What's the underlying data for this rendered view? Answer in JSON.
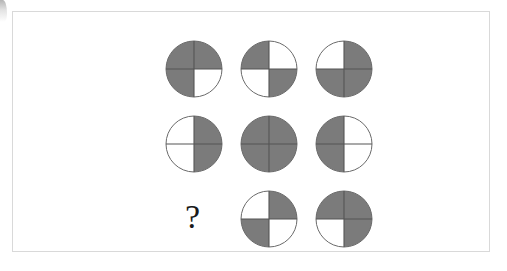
{
  "puzzle": {
    "type": "matrix-reasoning",
    "rows": 3,
    "columns": 3,
    "missing_cell": {
      "row": 3,
      "column": 1
    },
    "missing_cell_symbol": "?",
    "colors": {
      "shaded": "#7b7b7b",
      "unshaded": "#ffffff",
      "outline": "#6a6a6a",
      "divider": "#555555",
      "frame_border": "#d9d9d9",
      "background": "#ffffff",
      "question_mark": "#1a1a1a"
    },
    "circle": {
      "diameter_px": 56,
      "quadrant_order": [
        "top-left",
        "top-right",
        "bottom-right",
        "bottom-left"
      ]
    },
    "cells": [
      {
        "row": 1,
        "column": 1,
        "name": "circle-r1c1",
        "kind": "circle",
        "shaded_count": 3,
        "quadrants": {
          "top-left": "shaded",
          "top-right": "shaded",
          "bottom-right": "unshaded",
          "bottom-left": "shaded"
        }
      },
      {
        "row": 1,
        "column": 2,
        "name": "circle-r1c2",
        "kind": "circle",
        "shaded_count": 2,
        "quadrants": {
          "top-left": "shaded",
          "top-right": "unshaded",
          "bottom-right": "shaded",
          "bottom-left": "unshaded"
        }
      },
      {
        "row": 1,
        "column": 3,
        "name": "circle-r1c3",
        "kind": "circle",
        "shaded_count": 3,
        "quadrants": {
          "top-left": "unshaded",
          "top-right": "shaded",
          "bottom-right": "shaded",
          "bottom-left": "shaded"
        }
      },
      {
        "row": 2,
        "column": 1,
        "name": "circle-r2c1",
        "kind": "circle",
        "shaded_count": 2,
        "quadrants": {
          "top-left": "unshaded",
          "top-right": "shaded",
          "bottom-right": "shaded",
          "bottom-left": "unshaded"
        }
      },
      {
        "row": 2,
        "column": 2,
        "name": "circle-r2c2",
        "kind": "circle",
        "shaded_count": 4,
        "quadrants": {
          "top-left": "shaded",
          "top-right": "shaded",
          "bottom-right": "shaded",
          "bottom-left": "shaded"
        }
      },
      {
        "row": 2,
        "column": 3,
        "name": "circle-r2c3",
        "kind": "circle",
        "shaded_count": 2,
        "quadrants": {
          "top-left": "shaded",
          "top-right": "unshaded",
          "bottom-right": "unshaded",
          "bottom-left": "shaded"
        }
      },
      {
        "row": 3,
        "column": 1,
        "name": "missing-cell",
        "kind": "question-mark",
        "shaded_count": null,
        "quadrants": null
      },
      {
        "row": 3,
        "column": 2,
        "name": "circle-r3c2",
        "kind": "circle",
        "shaded_count": 2,
        "quadrants": {
          "top-left": "unshaded",
          "top-right": "shaded",
          "bottom-right": "unshaded",
          "bottom-left": "shaded"
        }
      },
      {
        "row": 3,
        "column": 3,
        "name": "circle-r3c3",
        "kind": "circle",
        "shaded_count": 3,
        "quadrants": {
          "top-left": "shaded",
          "top-right": "shaded",
          "bottom-right": "shaded",
          "bottom-left": "unshaded"
        }
      }
    ]
  }
}
